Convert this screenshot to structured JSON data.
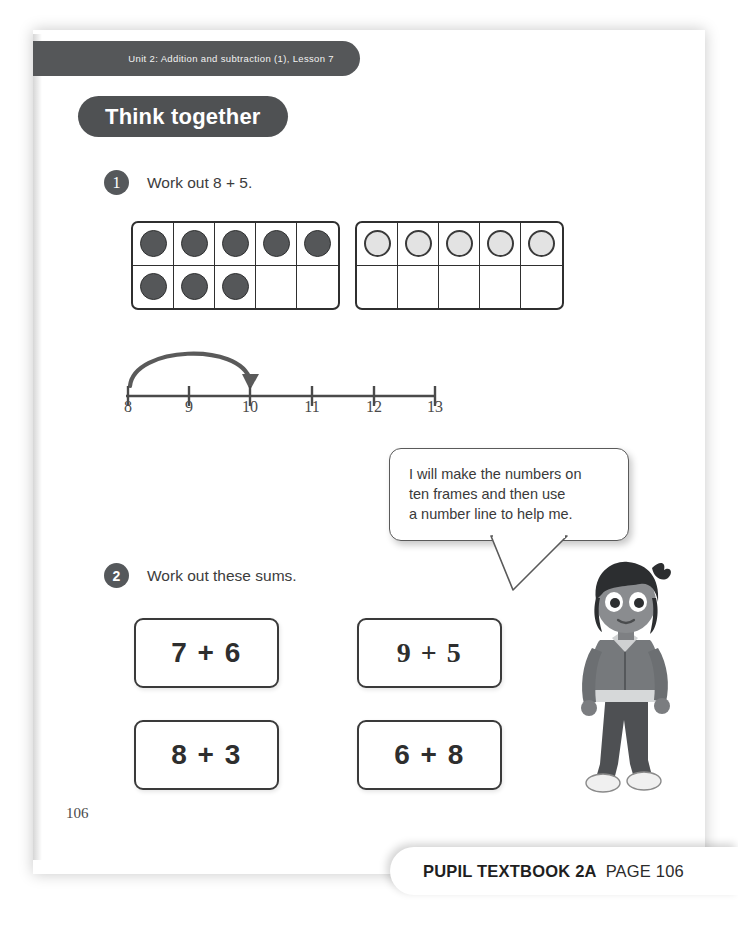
{
  "page": {
    "unit_banner": "Unit 2: Addition and subtraction (1), Lesson 7",
    "section_title": "Think together",
    "page_number": "106"
  },
  "questions": [
    {
      "number": "1",
      "text": "Work out 8 + 5."
    },
    {
      "number": "2",
      "text": "Work out these sums."
    }
  ],
  "ten_frames": [
    {
      "name": "first-addend",
      "capacity": 10,
      "filled": 8,
      "counter_color": "#555759",
      "cells": [
        1,
        1,
        1,
        1,
        1,
        1,
        1,
        1,
        0,
        0
      ]
    },
    {
      "name": "second-addend",
      "capacity": 10,
      "filled": 5,
      "counter_color": "#e3e3e3",
      "cells": [
        1,
        1,
        1,
        1,
        1,
        0,
        0,
        0,
        0,
        0
      ]
    }
  ],
  "number_line": {
    "ticks": [
      "8",
      "9",
      "10",
      "11",
      "12",
      "13"
    ],
    "jump_from": "8",
    "jump_to": "10"
  },
  "speech_bubble": {
    "lines": [
      "I will make the numbers on",
      "ten frames and then use",
      "a number line to help me."
    ]
  },
  "sums": [
    {
      "a": "7",
      "op": "+",
      "b": "6",
      "label": "7 + 6"
    },
    {
      "a": "9",
      "op": "+",
      "b": "5",
      "label": "9 + 5"
    },
    {
      "a": "8",
      "op": "+",
      "b": "3",
      "label": "8 + 3"
    },
    {
      "a": "6",
      "op": "+",
      "b": "8",
      "label": "6 + 8"
    }
  ],
  "footer": {
    "book": "PUPIL TEXTBOOK 2A",
    "page": "PAGE 106"
  },
  "colors": {
    "banner": "#555759",
    "pill": "#4f5153",
    "ink": "#3a3a3a",
    "counter_dark": "#555759",
    "counter_light": "#e3e3e3"
  }
}
